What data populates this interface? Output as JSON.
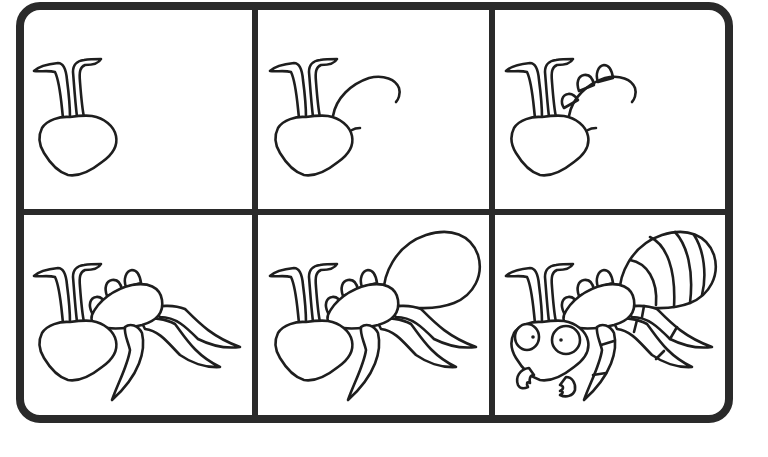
{
  "title": "How to draw an ant",
  "colors": {
    "ink": "#1e1e1e",
    "frame": "#2a2a2a",
    "background": "#ffffff"
  },
  "grid": {
    "rows": 2,
    "columns": 3
  },
  "panels": [
    {
      "step": "1",
      "label": "Head with antennae"
    },
    {
      "step": "2",
      "label": "Add thorax outline"
    },
    {
      "step": "3",
      "label": "Add three bumps on thorax"
    },
    {
      "step": "4",
      "label": "Add six legs"
    },
    {
      "step": "5",
      "label": "Add oval abdomen"
    },
    {
      "step": "6",
      "label": "Add eyes, mandibles, abdomen stripes and leg segments"
    }
  ]
}
